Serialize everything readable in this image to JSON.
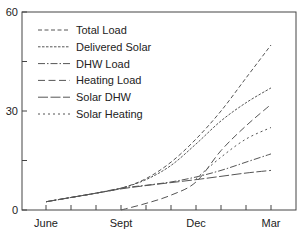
{
  "chart_data": {
    "type": "line",
    "title": "",
    "xlabel": "",
    "ylabel": "",
    "ylim": [
      0,
      60
    ],
    "yticks": [
      0,
      15,
      30,
      45,
      60
    ],
    "ytick_labels": [
      "0",
      "",
      "30",
      "",
      "60"
    ],
    "x_tick_labels": [
      "June",
      "Sept",
      "Dec",
      "Mar"
    ],
    "x_months": [
      "Jun",
      "Jul",
      "Aug",
      "Sep",
      "Oct",
      "Nov",
      "Dec",
      "Jan",
      "Feb",
      "Mar"
    ],
    "grid": false,
    "legend_position": "upper left",
    "series": [
      {
        "name": "Total Load",
        "dash": "4,2.5",
        "x": [
          0,
          1,
          2,
          3,
          4,
          5,
          6,
          7,
          8,
          9
        ],
        "values": [
          2.5,
          3.8,
          5.1,
          6.6,
          9.5,
          14.5,
          21.5,
          30,
          40,
          50
        ]
      },
      {
        "name": "Delivered Solar",
        "dash": "2.5,1.5",
        "x": [
          0,
          1,
          2,
          3,
          4,
          5,
          6,
          7,
          8,
          9
        ],
        "values": [
          2.5,
          3.8,
          5.1,
          6.6,
          9.2,
          13.5,
          20,
          27,
          32.5,
          37
        ]
      },
      {
        "name": "DHW Load",
        "dash": "7,2,1.5,2",
        "x": [
          0,
          1,
          2,
          3,
          4,
          5,
          6,
          7,
          8,
          9
        ],
        "values": [
          2.5,
          3.8,
          5.1,
          6.6,
          7.5,
          8.5,
          10,
          12,
          14.5,
          17
        ]
      },
      {
        "name": "Heating Load",
        "dash": "7,3.5",
        "x": [
          3,
          4,
          5,
          6,
          7,
          8,
          9
        ],
        "values": [
          0,
          2,
          4.5,
          8.5,
          18,
          25.5,
          32
        ]
      },
      {
        "name": "Solar DHW",
        "dash": "10,2.5",
        "x": [
          0,
          1,
          2,
          3,
          4,
          5,
          6,
          7,
          8,
          9
        ],
        "values": [
          2.5,
          3.8,
          5.1,
          6.4,
          7.4,
          8.3,
          9.2,
          10.2,
          11.2,
          12
        ]
      },
      {
        "name": "Solar Heating",
        "dash": "2,3",
        "x": [
          6,
          7,
          8,
          9
        ],
        "values": [
          9.5,
          16,
          21.5,
          25
        ]
      }
    ]
  }
}
